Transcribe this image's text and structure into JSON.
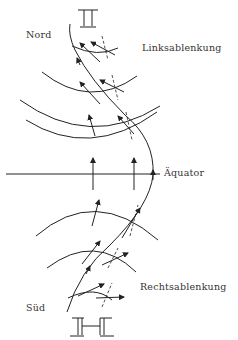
{
  "labels": {
    "north": "Nord",
    "south": "Süd",
    "left_deflection": "Linksablenkung",
    "right_deflection": "Rechtsablenkung",
    "equator": "Äquator"
  },
  "symbols": {
    "north_pole": "pole-symbol-top",
    "south_pole": "pole-symbol-bottom"
  }
}
